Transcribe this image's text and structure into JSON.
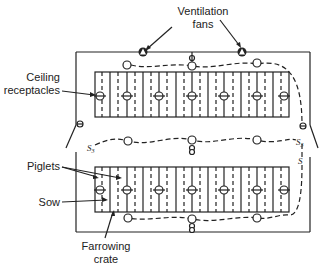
{
  "diagram": {
    "type": "floor-plan",
    "labels": {
      "ventilation_fans_line1": "Ventilation",
      "ventilation_fans_line2": "fans",
      "ceiling_receptacles_line1": "Ceiling",
      "ceiling_receptacles_line2": "receptacles",
      "piglets": "Piglets",
      "sow": "Sow",
      "farrowing_crate_line1": "Farrowing",
      "farrowing_crate_line2": "crate"
    },
    "switch_labels": {
      "s3_left": "S",
      "s3_left_sub": "3",
      "s3_right": "S",
      "s3_right_sub": "3",
      "s_single": "S"
    },
    "elements": {
      "ventilation_fans": 2,
      "crate_rows": 2,
      "receptacles_per_row": 7,
      "ceiling_lights_per_circuit": 3
    },
    "colors": {
      "line": "#222222",
      "background": "#ffffff"
    }
  }
}
